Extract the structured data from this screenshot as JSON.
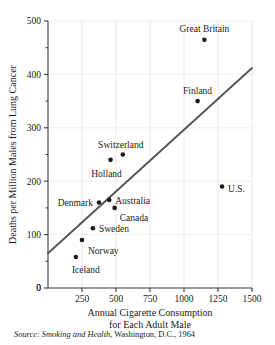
{
  "figure": {
    "cut_off_title": "",
    "source_note": {
      "prefix": "Source:",
      "work": "Smoking and Health",
      "rest": ", Washington, D.C., 1964"
    }
  },
  "chart_data": {
    "type": "scatter",
    "title": "",
    "xlabel_line1": "Annual Cigarette Consumption",
    "xlabel_line2": "for Each Adult Male",
    "ylabel": "Deaths per Million Males from Lung Cancer",
    "xlim": [
      0,
      1500
    ],
    "ylim": [
      0,
      500
    ],
    "xticks": [
      0,
      250,
      500,
      750,
      1000,
      1250,
      1500
    ],
    "xtick_labels": [
      "0",
      "250",
      "500",
      "750",
      "1000",
      "1250",
      "1500"
    ],
    "yticks": [
      0,
      100,
      200,
      300,
      400,
      500
    ],
    "ytick_labels": [
      "0",
      "100",
      "200",
      "300",
      "400",
      "500"
    ],
    "minor_ytick_step": 50,
    "grid": "vertical-and-horizontal-faint",
    "legend": "none",
    "marker_color": "#1a1a1a",
    "line_color": "#555555",
    "points": [
      {
        "name": "Iceland",
        "x": 205,
        "y": 58,
        "label_dx": -4,
        "label_dy": 16,
        "anchor": "start"
      },
      {
        "name": "Norway",
        "x": 250,
        "y": 90,
        "label_dx": 6,
        "label_dy": 14,
        "anchor": "start"
      },
      {
        "name": "Sweden",
        "x": 330,
        "y": 112,
        "label_dx": 6,
        "label_dy": 4,
        "anchor": "start"
      },
      {
        "name": "Canada",
        "x": 490,
        "y": 150,
        "label_dx": 5,
        "label_dy": 13,
        "anchor": "start"
      },
      {
        "name": "Denmark",
        "x": 375,
        "y": 160,
        "label_dx": -6,
        "label_dy": 3,
        "anchor": "end"
      },
      {
        "name": "Australia",
        "x": 450,
        "y": 165,
        "label_dx": 6,
        "label_dy": 4,
        "anchor": "start"
      },
      {
        "name": "Holland",
        "x": 460,
        "y": 240,
        "label_dx": -4,
        "label_dy": 17,
        "anchor": "middle"
      },
      {
        "name": "Switzerland",
        "x": 550,
        "y": 250,
        "label_dx": -2,
        "label_dy": -7,
        "anchor": "middle"
      },
      {
        "name": "U.S.",
        "x": 1280,
        "y": 190,
        "label_dx": 6,
        "label_dy": 5,
        "anchor": "start"
      },
      {
        "name": "Finland",
        "x": 1100,
        "y": 350,
        "label_dx": 0,
        "label_dy": -7,
        "anchor": "middle"
      },
      {
        "name": "Great Britain",
        "x": 1150,
        "y": 465,
        "label_dx": 0,
        "label_dy": -8,
        "anchor": "middle"
      }
    ],
    "trend_line": {
      "x_start": 0,
      "y_start": 65,
      "x_end": 1500,
      "y_end": 412
    }
  }
}
